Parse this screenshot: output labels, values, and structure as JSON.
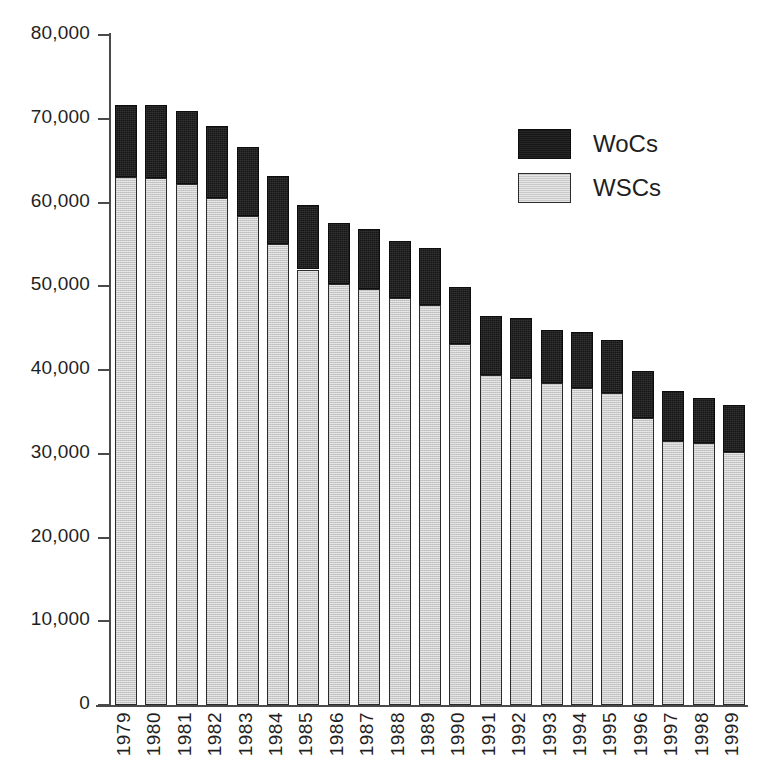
{
  "chart_data": {
    "type": "bar",
    "subtype": "stacked-vertical",
    "title": "",
    "subtitle": "",
    "xlabel": "",
    "ylabel": "",
    "ylim": [
      0,
      80000
    ],
    "ytick_values": [
      0,
      10000,
      20000,
      30000,
      40000,
      50000,
      60000,
      70000,
      80000
    ],
    "ytick_labels": [
      "0",
      "10,000",
      "20,000",
      "30,000",
      "40,000",
      "50,000",
      "60,000",
      "70,000",
      "80,000"
    ],
    "grid": false,
    "legend_position": "upper-right",
    "categories": [
      "1979",
      "1980",
      "1981",
      "1982",
      "1983",
      "1984",
      "1985",
      "1986",
      "1987",
      "1988",
      "1989",
      "1990",
      "1991",
      "1992",
      "1993",
      "1994",
      "1995",
      "1996",
      "1997",
      "1998",
      "1999"
    ],
    "series": [
      {
        "name": "WSCs",
        "color": "#c9c9c9",
        "stack_order": 0,
        "values": [
          63100,
          62900,
          62200,
          60500,
          58400,
          55100,
          52000,
          50300,
          49700,
          48600,
          47800,
          43100,
          39400,
          39000,
          38400,
          37900,
          37300,
          34300,
          31500,
          31300,
          30200
        ]
      },
      {
        "name": "WoCs",
        "color": "#161616",
        "stack_order": 1,
        "values": [
          8600,
          8700,
          8700,
          8600,
          8200,
          8100,
          7700,
          7300,
          7100,
          6800,
          6800,
          6800,
          7000,
          7200,
          6400,
          6600,
          6300,
          5600,
          6000,
          5400,
          5600
        ]
      }
    ],
    "totals": [
      71700,
      71600,
      70900,
      69100,
      66600,
      63200,
      59700,
      57600,
      56800,
      55400,
      54600,
      49900,
      46400,
      46200,
      44800,
      44500,
      43600,
      39900,
      37500,
      36700,
      35800
    ]
  },
  "legend": {
    "items": [
      {
        "label": "WoCs",
        "swatch": "black-swatch"
      },
      {
        "label": "WSCs",
        "swatch": "gray-swatch"
      }
    ]
  },
  "colors": {
    "wocs": "#161616",
    "wscs": "#c9c9c9",
    "axis": "#4a4a4a",
    "text": "#1f1f1f",
    "background": "#ffffff"
  }
}
